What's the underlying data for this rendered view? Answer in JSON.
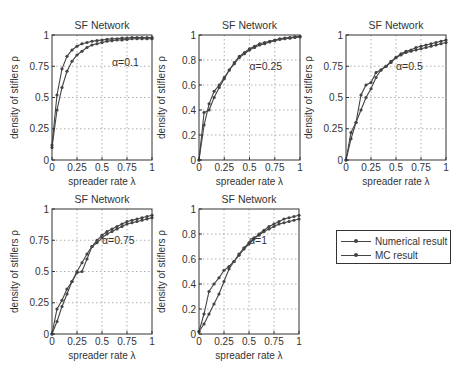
{
  "chart_data": [
    {
      "type": "line",
      "title": "SF Network",
      "annotation": "α=0.1",
      "xlabel": "spreader rate λ",
      "ylabel": "density of stiflers ρ",
      "xlim": [
        0,
        1
      ],
      "ylim": [
        0,
        1
      ],
      "xticks": [
        "0",
        "0.25",
        "0.5",
        "0.75",
        "1"
      ],
      "yticks": [
        "0",
        "0.25",
        "0.5",
        "0.75",
        "1"
      ],
      "grid": true,
      "x": [
        0,
        0.05,
        0.1,
        0.15,
        0.2,
        0.25,
        0.3,
        0.35,
        0.4,
        0.45,
        0.5,
        0.55,
        0.6,
        0.65,
        0.7,
        0.75,
        0.8,
        0.85,
        0.9,
        0.95,
        1
      ],
      "series": [
        {
          "name": "Numerical result",
          "values": [
            0.12,
            0.52,
            0.73,
            0.83,
            0.88,
            0.91,
            0.93,
            0.94,
            0.95,
            0.955,
            0.96,
            0.965,
            0.97,
            0.97,
            0.975,
            0.975,
            0.98,
            0.98,
            0.98,
            0.98,
            0.98
          ]
        },
        {
          "name": "MC result",
          "values": [
            0.1,
            0.4,
            0.58,
            0.71,
            0.79,
            0.84,
            0.87,
            0.9,
            0.92,
            0.93,
            0.94,
            0.95,
            0.955,
            0.96,
            0.96,
            0.965,
            0.97,
            0.97,
            0.97,
            0.97,
            0.97
          ]
        }
      ]
    },
    {
      "type": "line",
      "title": "SF Network",
      "annotation": "α=0.25",
      "xlabel": "spreader rate λ",
      "ylabel": "density of stiflers ρ",
      "xlim": [
        0,
        1
      ],
      "ylim": [
        0,
        1
      ],
      "xticks": [
        "0",
        "0.25",
        "0.5",
        "0.75",
        "1"
      ],
      "yticks": [
        "0",
        "0.2",
        "0.4",
        "0.6",
        "0.8",
        "1"
      ],
      "grid": true,
      "x": [
        0,
        0.05,
        0.1,
        0.15,
        0.2,
        0.25,
        0.3,
        0.35,
        0.4,
        0.45,
        0.5,
        0.55,
        0.6,
        0.65,
        0.7,
        0.75,
        0.8,
        0.85,
        0.9,
        0.95,
        1
      ],
      "series": [
        {
          "name": "Numerical result",
          "values": [
            0,
            0.38,
            0.4,
            0.5,
            0.58,
            0.65,
            0.72,
            0.78,
            0.83,
            0.86,
            0.89,
            0.91,
            0.93,
            0.94,
            0.95,
            0.96,
            0.97,
            0.975,
            0.98,
            0.985,
            0.99
          ]
        },
        {
          "name": "MC result",
          "values": [
            0,
            0.28,
            0.45,
            0.55,
            0.6,
            0.66,
            0.72,
            0.77,
            0.82,
            0.85,
            0.88,
            0.9,
            0.92,
            0.93,
            0.945,
            0.955,
            0.965,
            0.97,
            0.975,
            0.98,
            0.985
          ]
        }
      ]
    },
    {
      "type": "line",
      "title": "SF Network",
      "annotation": "α=0.5",
      "xlabel": "spreader rate λ",
      "ylabel": "density of stiflers ρ",
      "xlim": [
        0,
        1
      ],
      "ylim": [
        0,
        1
      ],
      "xticks": [
        "0",
        "0.25",
        "0.5",
        "0.75",
        "1"
      ],
      "yticks": [
        "0",
        "0.25",
        "0.5",
        "0.75",
        "1"
      ],
      "grid": true,
      "x": [
        0,
        0.05,
        0.1,
        0.15,
        0.2,
        0.25,
        0.3,
        0.35,
        0.4,
        0.45,
        0.5,
        0.55,
        0.6,
        0.65,
        0.7,
        0.75,
        0.8,
        0.85,
        0.9,
        0.95,
        1
      ],
      "series": [
        {
          "name": "Numerical result",
          "values": [
            0,
            0.22,
            0.3,
            0.52,
            0.6,
            0.62,
            0.7,
            0.72,
            0.75,
            0.78,
            0.82,
            0.85,
            0.87,
            0.88,
            0.9,
            0.91,
            0.92,
            0.93,
            0.94,
            0.95,
            0.96
          ]
        },
        {
          "name": "MC result",
          "values": [
            0,
            0.17,
            0.3,
            0.4,
            0.5,
            0.57,
            0.66,
            0.72,
            0.75,
            0.79,
            0.82,
            0.84,
            0.86,
            0.87,
            0.88,
            0.89,
            0.9,
            0.91,
            0.92,
            0.93,
            0.94
          ]
        }
      ]
    },
    {
      "type": "line",
      "title": "SF Network",
      "annotation": "α=0.75",
      "xlabel": "spreader rate λ",
      "ylabel": "density of stiflers ρ",
      "xlim": [
        0,
        1
      ],
      "ylim": [
        0,
        1
      ],
      "xticks": [
        "0",
        "0.25",
        "0.5",
        "0.75",
        "1"
      ],
      "yticks": [
        "0",
        "0.25",
        "0.5",
        "0.75",
        "1"
      ],
      "grid": true,
      "x": [
        0,
        0.05,
        0.1,
        0.15,
        0.2,
        0.25,
        0.3,
        0.35,
        0.4,
        0.45,
        0.5,
        0.55,
        0.6,
        0.65,
        0.7,
        0.75,
        0.8,
        0.85,
        0.9,
        0.95,
        1
      ],
      "series": [
        {
          "name": "Numerical result",
          "values": [
            0,
            0.2,
            0.27,
            0.36,
            0.42,
            0.49,
            0.5,
            0.6,
            0.7,
            0.75,
            0.79,
            0.82,
            0.84,
            0.86,
            0.88,
            0.9,
            0.91,
            0.92,
            0.93,
            0.94,
            0.95
          ]
        },
        {
          "name": "MC result",
          "values": [
            0,
            0.1,
            0.22,
            0.32,
            0.42,
            0.5,
            0.57,
            0.64,
            0.7,
            0.73,
            0.77,
            0.8,
            0.82,
            0.84,
            0.86,
            0.88,
            0.89,
            0.9,
            0.91,
            0.92,
            0.93
          ]
        }
      ]
    },
    {
      "type": "line",
      "title": "SF Network",
      "annotation": "α=1",
      "xlabel": "spreader rate λ",
      "ylabel": "density of stiflers ρ",
      "xlim": [
        0,
        1
      ],
      "ylim": [
        0,
        1
      ],
      "xticks": [
        "0",
        "0.25",
        "0.5",
        "0.75",
        "1"
      ],
      "yticks": [
        "0",
        "0.2",
        "0.4",
        "0.6",
        "0.8",
        "1"
      ],
      "grid": true,
      "x": [
        0,
        0.05,
        0.1,
        0.15,
        0.2,
        0.25,
        0.3,
        0.35,
        0.4,
        0.45,
        0.5,
        0.55,
        0.6,
        0.65,
        0.7,
        0.75,
        0.8,
        0.85,
        0.9,
        0.95,
        1
      ],
      "series": [
        {
          "name": "Numerical result",
          "values": [
            0.02,
            0.16,
            0.34,
            0.4,
            0.45,
            0.51,
            0.54,
            0.58,
            0.63,
            0.68,
            0.72,
            0.76,
            0.8,
            0.83,
            0.86,
            0.88,
            0.9,
            0.92,
            0.93,
            0.94,
            0.95
          ]
        },
        {
          "name": "MC result",
          "values": [
            0.02,
            0.08,
            0.16,
            0.24,
            0.32,
            0.42,
            0.52,
            0.58,
            0.64,
            0.69,
            0.73,
            0.77,
            0.79,
            0.82,
            0.84,
            0.86,
            0.88,
            0.89,
            0.9,
            0.91,
            0.92
          ]
        }
      ]
    }
  ],
  "layout": {
    "panels": [
      {
        "left": 52,
        "top": 35,
        "width": 100,
        "height": 125,
        "annotation_pos": [
          0.6,
          0.75
        ]
      },
      {
        "left": 199,
        "top": 35,
        "width": 101,
        "height": 125,
        "annotation_pos": [
          0.5,
          0.72
        ]
      },
      {
        "left": 346,
        "top": 35,
        "width": 100,
        "height": 125,
        "annotation_pos": [
          0.5,
          0.72
        ]
      },
      {
        "left": 52,
        "top": 209,
        "width": 100,
        "height": 125,
        "annotation_pos": [
          0.5,
          0.72
        ]
      },
      {
        "left": 199,
        "top": 209,
        "width": 100,
        "height": 125,
        "annotation_pos": [
          0.5,
          0.72
        ]
      }
    ]
  },
  "legend": {
    "items": [
      {
        "label": "Numerical result"
      },
      {
        "label": "MC result"
      }
    ]
  },
  "colors": {
    "line": "#444444",
    "axis": "#333333",
    "grid": "#9a9a9a",
    "text": "#333333"
  }
}
